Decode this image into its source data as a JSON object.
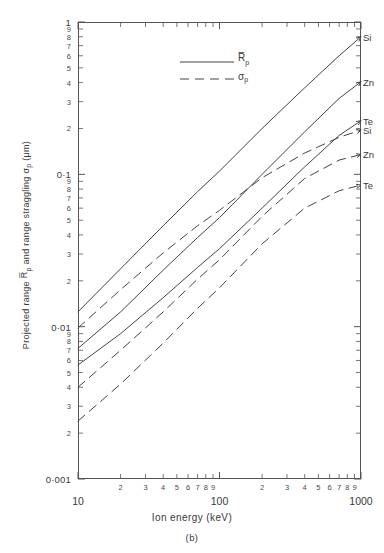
{
  "chart_data": {
    "type": "line",
    "title": "",
    "caption": "(b)",
    "xlabel": "Ion energy (keV)",
    "ylabel": "Projected range R̄p and range straggling σp (μm)",
    "xscale": "log",
    "yscale": "log",
    "xlim": [
      10,
      1000
    ],
    "ylim": [
      0.001,
      1
    ],
    "grid": false,
    "legend_position": "top-left",
    "legend": [
      {
        "label": "R̄p",
        "style": "solid",
        "meaning": "Projected range"
      },
      {
        "label": "σp",
        "style": "dashed",
        "meaning": "Range straggling"
      }
    ],
    "x_major_ticks": [
      "10",
      "100",
      "1000"
    ],
    "x_minor_ticks": [
      "2",
      "3",
      "4",
      "5",
      "6",
      "7",
      "8",
      "9"
    ],
    "y_major_ticks": [
      "1",
      "0·1",
      "0·01",
      "0·001"
    ],
    "y_minor_ticks": [
      "9",
      "8",
      "7",
      "6",
      "5",
      "4",
      "3",
      "2"
    ],
    "series": [
      {
        "name": "Si",
        "style": "solid",
        "quantity": "R̄p",
        "end_label": "Si",
        "x": [
          10,
          20,
          40,
          70,
          100,
          200,
          400,
          700,
          1000
        ],
        "y": [
          0.0125,
          0.024,
          0.046,
          0.077,
          0.105,
          0.2,
          0.37,
          0.6,
          0.8
        ]
      },
      {
        "name": "Zn",
        "style": "solid",
        "quantity": "R̄p",
        "end_label": "Zn",
        "x": [
          10,
          20,
          40,
          70,
          100,
          200,
          400,
          700,
          1000
        ],
        "y": [
          0.0072,
          0.0125,
          0.0235,
          0.0385,
          0.052,
          0.1,
          0.19,
          0.315,
          0.405
        ]
      },
      {
        "name": "Te",
        "style": "solid",
        "quantity": "R̄p",
        "end_label": "Te",
        "x": [
          10,
          20,
          40,
          70,
          100,
          200,
          400,
          700,
          1000
        ],
        "y": [
          0.0056,
          0.009,
          0.0155,
          0.0245,
          0.0325,
          0.06,
          0.112,
          0.18,
          0.225
        ]
      },
      {
        "name": "Si",
        "style": "dashed",
        "quantity": "σp",
        "end_label": "Si",
        "x": [
          10,
          20,
          40,
          70,
          100,
          200,
          400,
          700,
          1000
        ],
        "y": [
          0.0098,
          0.0175,
          0.0305,
          0.046,
          0.058,
          0.095,
          0.138,
          0.175,
          0.195
        ]
      },
      {
        "name": "Zn",
        "style": "dashed",
        "quantity": "σp",
        "end_label": "Zn",
        "x": [
          10,
          20,
          40,
          70,
          100,
          200,
          400,
          700,
          1000
        ],
        "y": [
          0.004,
          0.007,
          0.0125,
          0.0205,
          0.0275,
          0.053,
          0.094,
          0.124,
          0.135
        ]
      },
      {
        "name": "Te",
        "style": "dashed",
        "quantity": "σp",
        "end_label": "Te",
        "x": [
          10,
          20,
          40,
          70,
          100,
          200,
          400,
          700,
          1000
        ],
        "y": [
          0.0024,
          0.0042,
          0.0078,
          0.0132,
          0.018,
          0.035,
          0.06,
          0.078,
          0.085
        ]
      }
    ],
    "end_labels": [
      {
        "text": "Si",
        "value": 0.8
      },
      {
        "text": "Zn",
        "value": 0.405
      },
      {
        "text": "Te",
        "value": 0.225
      },
      {
        "text": "Si",
        "value": 0.195
      },
      {
        "text": "Zn",
        "value": 0.135
      },
      {
        "text": "Te",
        "value": 0.085
      }
    ],
    "colors": {
      "line": "#444444",
      "axis": "#555555",
      "text": "#3a3a3a"
    }
  }
}
